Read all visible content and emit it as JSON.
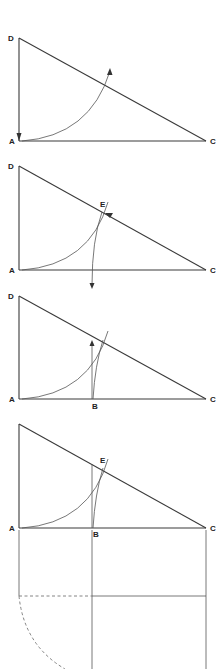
{
  "diagram": {
    "colors": {
      "line": "#3a3a3a",
      "arc": "#555555",
      "dashed": "#777777",
      "background": "#ffffff"
    },
    "panels": [
      {
        "step": 1,
        "labels": {
          "D": "D",
          "A": "A",
          "C": "C"
        }
      },
      {
        "step": 2,
        "labels": {
          "D": "D",
          "E": "E",
          "A": "A",
          "C": "C"
        }
      },
      {
        "step": 3,
        "labels": {
          "D": "D",
          "A": "A",
          "B": "B",
          "C": "C"
        }
      },
      {
        "step": 4,
        "labels": {
          "E": "E",
          "A": "A",
          "B": "B",
          "C": "C"
        }
      }
    ]
  }
}
